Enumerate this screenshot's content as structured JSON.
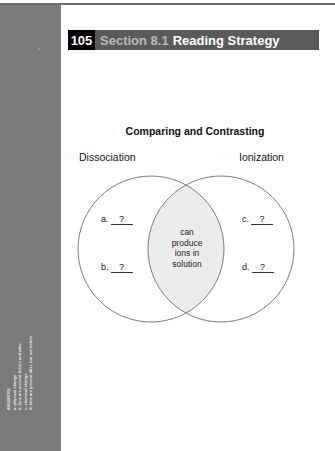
{
  "header": {
    "number": "105",
    "section": "Section 8.1",
    "title": "Reading Strategy"
  },
  "diagram": {
    "title": "Comparing and Contrasting",
    "left_label": "Dissociation",
    "right_label": "Ionization",
    "overlap_lines": [
      "can",
      "produce",
      "ions in",
      "solution"
    ],
    "blanks": [
      {
        "letter": "a.",
        "value": "?"
      },
      {
        "letter": "b.",
        "value": "?"
      },
      {
        "letter": "c.",
        "value": "?"
      },
      {
        "letter": "d.",
        "value": "?"
      }
    ],
    "colors": {
      "circle_stroke": "#7a7a7a",
      "overlap_fill": "#ececec"
    }
  },
  "sidebar": {
    "answers_title": "ANSWERS",
    "answers": [
      "a. physical change",
      "b. Ions are present before and after.",
      "c. chemical change",
      "d. Ions are present after, but not before."
    ]
  }
}
